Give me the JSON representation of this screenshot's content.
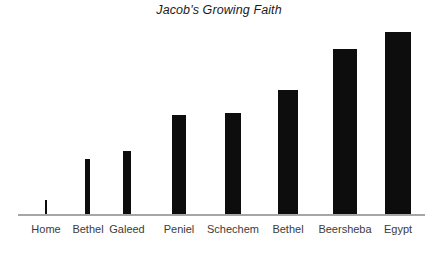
{
  "chart_data": {
    "type": "bar",
    "title": "Jacob's Growing Faith",
    "xlabel": "",
    "ylabel": "",
    "grid": false,
    "legend": "none",
    "axis": {
      "x_line_visible": true,
      "y_line_visible": false,
      "y_tick_labels_visible": false,
      "x_tick_labels_visible": true
    },
    "ylim": [
      0,
      200
    ],
    "categories": [
      "Home",
      "Bethel",
      "Galeed",
      "Peniel",
      "Schechem",
      "Bethel",
      "Beersheba",
      "Egypt"
    ],
    "values": [
      14,
      55,
      63,
      99,
      101,
      124,
      165,
      182
    ],
    "bar_color": "#0d0d0d",
    "bar_widths": [
      2,
      5,
      8,
      14,
      16,
      20,
      24,
      26
    ],
    "bar_left_positions": [
      45,
      85,
      123,
      172,
      225,
      278,
      333,
      385
    ],
    "label_centers": [
      46,
      88,
      127,
      179,
      233,
      288,
      345,
      398
    ]
  },
  "colors": {
    "background": "#ffffff",
    "bar": "#0d0d0d",
    "axis_line": "#a6a6a6",
    "title_text": "#1b1b1b",
    "label_text": "#3b3b3b"
  }
}
